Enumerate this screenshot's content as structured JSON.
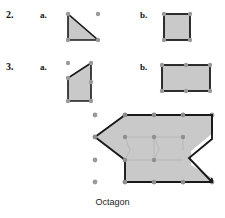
{
  "page": {
    "background_color": "#ffffff",
    "width": 225,
    "height": 218
  },
  "style": {
    "shape_fill": "#c9c9c9",
    "shape_stroke": "#1a1a1a",
    "grid_dot_color": "#9a9a9a",
    "interior_dot_color": "#8e8e8e",
    "interior_line_color": "#aaaaaa",
    "text_color": "#111111"
  },
  "problems": [
    {
      "number": "2.",
      "items": [
        {
          "letter": "a.",
          "shape_name": "right-triangle",
          "vertices": [
            [
              0,
              0
            ],
            [
              0,
              28
            ],
            [
              30,
              28
            ]
          ],
          "grid_dots": [
            [
              0,
              0
            ],
            [
              0,
              28
            ],
            [
              30,
              28
            ],
            [
              30,
              0
            ]
          ]
        },
        {
          "letter": "b.",
          "shape_name": "square",
          "vertices": [
            [
              0,
              0
            ],
            [
              26,
              0
            ],
            [
              26,
              26
            ],
            [
              0,
              26
            ]
          ],
          "grid_dots": [
            [
              0,
              0
            ],
            [
              26,
              0
            ],
            [
              26,
              26
            ],
            [
              0,
              26
            ]
          ]
        }
      ]
    },
    {
      "number": "3.",
      "items": [
        {
          "letter": "a.",
          "shape_name": "right-trapezoid",
          "vertices": [
            [
              0,
              13
            ],
            [
              24,
              0
            ],
            [
              24,
              38
            ],
            [
              0,
              38
            ]
          ],
          "grid_dots": [
            [
              0,
              13
            ],
            [
              24,
              0
            ],
            [
              24,
              38
            ],
            [
              0,
              38
            ],
            [
              0,
              0
            ],
            [
              24,
              19
            ]
          ]
        },
        {
          "letter": "b.",
          "shape_name": "rectangle",
          "vertices": [
            [
              0,
              0
            ],
            [
              52,
              0
            ],
            [
              52,
              26
            ],
            [
              0,
              26
            ]
          ],
          "grid_dots": [
            [
              0,
              0
            ],
            [
              26,
              0
            ],
            [
              52,
              0
            ],
            [
              52,
              26
            ],
            [
              26,
              26
            ],
            [
              0,
              26
            ]
          ]
        }
      ]
    }
  ],
  "main_figure": {
    "shape_name": "octagon",
    "caption": "Octagon",
    "vertices": [
      [
        34,
        8
      ],
      [
        98,
        8
      ],
      [
        98,
        34
      ],
      [
        70,
        58
      ],
      [
        98,
        82
      ],
      [
        98,
        82
      ],
      [
        34,
        82
      ],
      [
        8,
        45
      ]
    ],
    "octagon_points": "34,8 98,8 98,34 72,56 98,80 34,80 34,45 8,28",
    "grid_columns": 5,
    "grid_rows": 4
  },
  "caption_text": "Octagon"
}
